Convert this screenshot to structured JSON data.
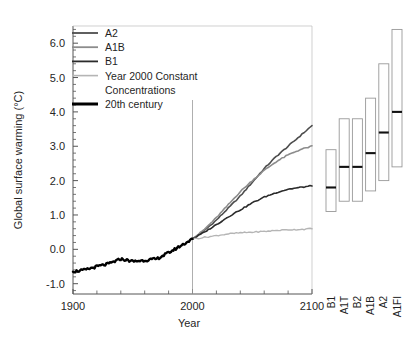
{
  "chart_data": {
    "type": "line",
    "title": "",
    "xlabel": "Year",
    "ylabel": "Global surface warming (°C)",
    "xlim": [
      1900,
      2100
    ],
    "ylim": [
      -1.3,
      6.5
    ],
    "xticks": [
      1900,
      2000,
      2100
    ],
    "xtick_labels": [
      "1900",
      "2000",
      "2100"
    ],
    "xminor_step": 20,
    "yticks": [
      -1.0,
      0.0,
      1.0,
      2.0,
      3.0,
      4.0,
      5.0,
      6.0
    ],
    "ytick_labels": [
      "-1.0",
      "0.0",
      "1.0",
      "2.0",
      "3.0",
      "4.0",
      "5.0",
      "6.0"
    ],
    "yminor_step": 0.2,
    "grid": false,
    "legend_position": "top-left",
    "reference_line_year": 2000,
    "series": [
      {
        "name": "A2",
        "color": "#4d4d4d",
        "width": 1.6,
        "x": [
          2000,
          2010,
          2020,
          2030,
          2040,
          2050,
          2060,
          2070,
          2080,
          2090,
          2100
        ],
        "values": [
          0.3,
          0.55,
          0.85,
          1.2,
          1.55,
          1.95,
          2.35,
          2.7,
          3.0,
          3.3,
          3.6
        ]
      },
      {
        "name": "A1B",
        "color": "#8c8c8c",
        "width": 1.6,
        "x": [
          2000,
          2010,
          2020,
          2030,
          2040,
          2050,
          2060,
          2070,
          2080,
          2090,
          2100
        ],
        "values": [
          0.3,
          0.58,
          0.92,
          1.3,
          1.68,
          2.0,
          2.3,
          2.55,
          2.75,
          2.9,
          3.0
        ]
      },
      {
        "name": "B1",
        "color": "#2b2b2b",
        "width": 1.6,
        "x": [
          2000,
          2010,
          2020,
          2030,
          2040,
          2050,
          2060,
          2070,
          2080,
          2090,
          2100
        ],
        "values": [
          0.3,
          0.5,
          0.72,
          0.95,
          1.15,
          1.35,
          1.52,
          1.65,
          1.75,
          1.8,
          1.85
        ]
      },
      {
        "name": "Year 2000 Constant Concentrations",
        "color": "#b5b5b5",
        "width": 1.4,
        "x": [
          2000,
          2010,
          2020,
          2030,
          2040,
          2050,
          2060,
          2070,
          2080,
          2090,
          2100
        ],
        "values": [
          0.3,
          0.35,
          0.4,
          0.45,
          0.48,
          0.5,
          0.52,
          0.55,
          0.57,
          0.58,
          0.6
        ]
      },
      {
        "name": "20th century",
        "color": "#000000",
        "width": 2.4,
        "x": [
          1900,
          1910,
          1920,
          1930,
          1940,
          1950,
          1960,
          1970,
          1980,
          1990,
          2000
        ],
        "values": [
          -0.65,
          -0.6,
          -0.5,
          -0.42,
          -0.28,
          -0.35,
          -0.32,
          -0.28,
          -0.1,
          0.1,
          0.3
        ]
      }
    ],
    "scenario_bars": {
      "ylabel_note": "Likely range and best estimate of warming at 2090-2099",
      "items": [
        {
          "label": "B1",
          "low": 1.1,
          "high": 2.9,
          "best": 1.8
        },
        {
          "label": "A1T",
          "low": 1.4,
          "high": 3.8,
          "best": 2.4
        },
        {
          "label": "B2",
          "low": 1.4,
          "high": 3.8,
          "best": 2.4
        },
        {
          "label": "A1B",
          "low": 1.7,
          "high": 4.4,
          "best": 2.8
        },
        {
          "label": "A2",
          "low": 2.0,
          "high": 5.4,
          "best": 3.4
        },
        {
          "label": "A1FI",
          "low": 2.4,
          "high": 6.4,
          "best": 4.0
        }
      ]
    }
  },
  "legend": {
    "entries": [
      {
        "label": "A2"
      },
      {
        "label": "A1B"
      },
      {
        "label": "B1"
      },
      {
        "label": "Year 2000 Constant"
      },
      {
        "label": "Concentrations"
      },
      {
        "label": "20th century"
      }
    ]
  },
  "colors": {
    "a2": "#4d4d4d",
    "a1b": "#8c8c8c",
    "b1": "#2b2b2b",
    "constant": "#b5b5b5",
    "twentieth": "#000000",
    "axis": "#555555",
    "bar_outline": "#999999",
    "bar_median": "#111111",
    "background": "#ffffff"
  }
}
